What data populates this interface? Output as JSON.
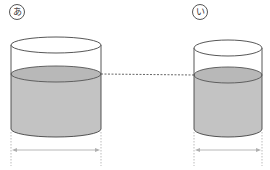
{
  "diagram": {
    "containers": [
      {
        "id": "a",
        "label": "あ",
        "description": "wider cylinder, partially filled with water"
      },
      {
        "id": "i",
        "label": "い",
        "description": "narrower cylinder, partially filled with water"
      }
    ],
    "annotations": {
      "water_level_line": "dashed horizontal line indicating same water height",
      "width_arrows": "double-headed arrows indicating base diameter"
    },
    "colors": {
      "water": "#c3c3c3",
      "water_top": "#b8b8b8",
      "outline": "#444444",
      "guide": "#aaaaaa",
      "arrow": "#b0b0b0"
    }
  }
}
